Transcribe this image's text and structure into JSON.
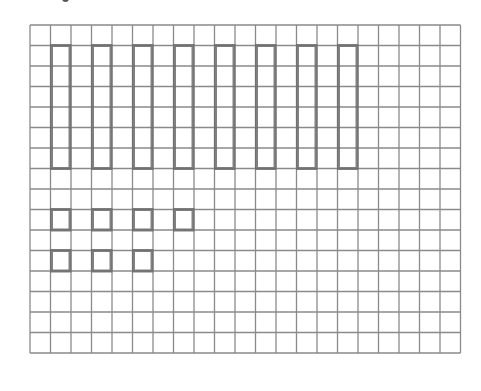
{
  "figure": {
    "grid": {
      "left": 30,
      "top": 25,
      "cell": 20.5,
      "cols": 21,
      "rows": 16,
      "line_color": "#8a8a8a"
    },
    "pencil_color": "#6b6b6b",
    "tall_rectangles": [
      {
        "col": 1,
        "row": 1,
        "w": 1,
        "h": 6
      },
      {
        "col": 3,
        "row": 1,
        "w": 1,
        "h": 6
      },
      {
        "col": 5,
        "row": 1,
        "w": 1,
        "h": 6
      },
      {
        "col": 7,
        "row": 1,
        "w": 1,
        "h": 6
      },
      {
        "col": 9,
        "row": 1,
        "w": 1,
        "h": 6
      },
      {
        "col": 11,
        "row": 1,
        "w": 1,
        "h": 6
      },
      {
        "col": 13,
        "row": 1,
        "w": 1,
        "h": 6
      },
      {
        "col": 15,
        "row": 1,
        "w": 1,
        "h": 6
      }
    ],
    "small_squares": [
      {
        "col": 1,
        "row": 9,
        "w": 1,
        "h": 1
      },
      {
        "col": 3,
        "row": 9,
        "w": 1,
        "h": 1
      },
      {
        "col": 5,
        "row": 9,
        "w": 1,
        "h": 1
      },
      {
        "col": 7,
        "row": 9,
        "w": 1,
        "h": 1
      },
      {
        "col": 1,
        "row": 11,
        "w": 1,
        "h": 1
      },
      {
        "col": 3,
        "row": 11,
        "w": 1,
        "h": 1
      },
      {
        "col": 5,
        "row": 11,
        "w": 1,
        "h": 1
      }
    ],
    "counts": {
      "tall_rectangles": 8,
      "small_squares": 7
    }
  }
}
